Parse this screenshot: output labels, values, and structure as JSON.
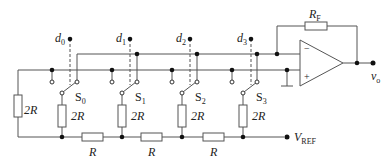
{
  "diagram": {
    "type": "R-2R ladder D/A converter circuit",
    "colors": {
      "wire": "#555555",
      "node": "#111111"
    },
    "data_inputs": [
      {
        "name": "d",
        "sub": "0"
      },
      {
        "name": "d",
        "sub": "1"
      },
      {
        "name": "d",
        "sub": "2"
      },
      {
        "name": "d",
        "sub": "3"
      }
    ],
    "switches": [
      {
        "name": "S",
        "sub": "0"
      },
      {
        "name": "S",
        "sub": "1"
      },
      {
        "name": "S",
        "sub": "2"
      },
      {
        "name": "S",
        "sub": "3"
      }
    ],
    "branch_resistors": [
      "2R",
      "2R",
      "2R",
      "2R"
    ],
    "termination_resistor": "2R",
    "series_resistors": [
      "R",
      "R",
      "R"
    ],
    "feedback_resistor": {
      "name": "R",
      "sub": "F"
    },
    "opamp": {
      "minus": "−",
      "plus": "+"
    },
    "output": {
      "name": "v",
      "sub": "o"
    },
    "reference": {
      "name": "V",
      "sub": "REF"
    }
  }
}
